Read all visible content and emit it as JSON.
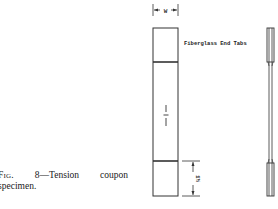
{
  "figure": {
    "caption": {
      "label": "Fig.",
      "number": "8",
      "title_part1": "—Tension",
      "title_part2": "coupon",
      "title_line2": "specimen."
    },
    "annotations": {
      "end_tabs_label": "Fiberglass End Tabs",
      "width_dimension": "W",
      "tab_length_dimension": "1½"
    },
    "views": [
      "front-view",
      "side-profile-view"
    ],
    "colors": {
      "line": "#333333",
      "background": "#ffffff"
    }
  }
}
